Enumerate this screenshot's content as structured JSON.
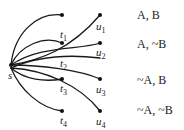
{
  "diagram": {
    "source": {
      "id": "s",
      "label": "s",
      "x": 11,
      "y": 65
    },
    "t_nodes": [
      {
        "id": "t0",
        "label": "",
        "x": 62,
        "y": 15
      },
      {
        "id": "t1",
        "label": "t",
        "sub": "1",
        "x": 62,
        "y": 43
      },
      {
        "id": "t2",
        "label": "t",
        "sub": "2",
        "x": 62,
        "y": 65
      },
      {
        "id": "t3",
        "label": "t",
        "sub": "3",
        "x": 62,
        "y": 79
      },
      {
        "id": "t4",
        "label": "t",
        "sub": "4",
        "x": 62,
        "y": 111
      }
    ],
    "u_nodes": [
      {
        "id": "u1",
        "label": "u",
        "sub": "1",
        "x": 100,
        "y": 15
      },
      {
        "id": "u2",
        "label": "u",
        "sub": "2",
        "x": 100,
        "y": 43
      },
      {
        "id": "u3",
        "label": "u",
        "sub": "3",
        "x": 100,
        "y": 79
      },
      {
        "id": "u4",
        "label": "u",
        "sub": "4",
        "x": 100,
        "y": 111
      }
    ],
    "row_labels": [
      "A, B",
      "A, ~B",
      "~A, B",
      "~A, ~B"
    ],
    "colors": {
      "edge": "#1a1a1a",
      "node": "#111111",
      "text": "#222222"
    }
  }
}
